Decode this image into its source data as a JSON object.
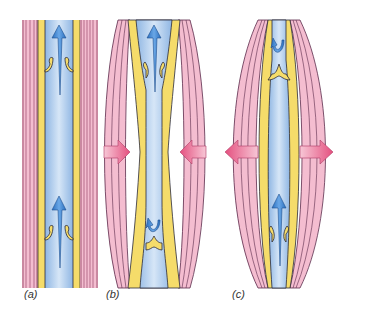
{
  "figure": {
    "colors": {
      "muscle_pink": "#f2b5c8",
      "muscle_pink_light": "#f9d6e1",
      "stripe_dark": "#7a2a4a",
      "wall_yellow": "#f5dc6a",
      "lumen_blue": "#a9c9ec",
      "lumen_blue_light": "#d6e6f7",
      "arrow_blue": "#3f86d1",
      "arrow_pink": "#e85b8c",
      "outline": "#2a2a3a"
    },
    "panels": [
      {
        "id": "a",
        "label": "(a)",
        "state": "muscles relaxed, both valves open, blood flows upward",
        "arrows": "upward flow"
      },
      {
        "id": "b",
        "label": "(b)",
        "state": "muscles contract, vein compressed, upper valve open, lower valve closed",
        "arrows": "compression inward"
      },
      {
        "id": "c",
        "label": "(c)",
        "state": "muscles relax, vein expands, upper valve closed, lower valve open",
        "arrows": "expansion outward"
      }
    ]
  }
}
